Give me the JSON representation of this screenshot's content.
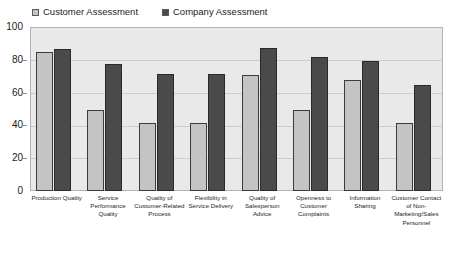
{
  "chart_data": {
    "type": "bar",
    "title": "",
    "xlabel": "",
    "ylabel": "",
    "ylim": [
      0,
      100
    ],
    "yticks": [
      "0",
      "20",
      "40",
      "60",
      "80",
      "100"
    ],
    "grid": true,
    "legend_position": "top-left",
    "categories": [
      "Production Quality",
      "Service Performance Quality",
      "Quality of Customer-Related Process",
      "Flexibility in Service Delivery",
      "Quality of Salesperson Advice",
      "Openness to Customer Complaints",
      "Information Sharing",
      "Customer Contact of Non-Marketing/Sales Personnel"
    ],
    "series": [
      {
        "name": "Customer Assessment",
        "color": "#c4c4c4",
        "values": [
          85,
          50,
          42,
          42,
          71,
          50,
          68,
          42
        ]
      },
      {
        "name": "Company Assessment",
        "color": "#4a4a4a",
        "values": [
          87,
          78,
          72,
          72,
          88,
          82,
          80,
          65
        ]
      }
    ]
  },
  "legend": {
    "items": [
      {
        "label": "Customer Assessment",
        "swatch": "light-gray-swatch"
      },
      {
        "label": "Company Assessment",
        "swatch": "dark-gray-swatch"
      }
    ]
  },
  "axis": {
    "y_ticks": [
      "100",
      "80",
      "60",
      "40",
      "20",
      "0"
    ]
  },
  "colors": {
    "customer_bar": "#c4c4c4",
    "company_bar": "#4a4a4a",
    "plot_background": "#e9e9e9",
    "gridline": "#cdcdcd",
    "border": "#b2b2b2"
  }
}
